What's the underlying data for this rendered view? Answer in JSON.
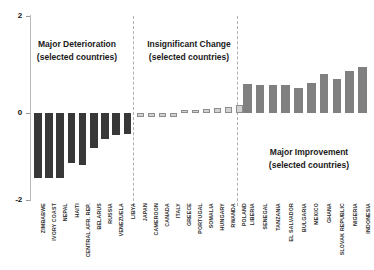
{
  "chart_data": {
    "type": "bar",
    "title": "",
    "xlabel": "",
    "ylabel": "",
    "ylim": [
      -2,
      2
    ],
    "yticks": [
      "2",
      "0",
      "-2"
    ],
    "grid": false,
    "legend": "none",
    "annotations": [
      {
        "line1": "Major Deterioration",
        "line2": "(selected countries)"
      },
      {
        "line1": "Insignificant Change",
        "line2": "(selected countries)"
      },
      {
        "line1": "Major Improvement",
        "line2": "(selected countries)"
      }
    ],
    "groups": [
      {
        "name": "Major Deterioration",
        "color": "#383838",
        "categories": [
          "ZIMBABWE",
          "IVORY COAST",
          "NEPAL",
          "HAITI",
          "CENTRAL AFR. REP.",
          "BELARUS",
          "RUSSIA",
          "VENEZUELA",
          "LIBYA"
        ],
        "values": [
          -1.34,
          -1.34,
          -1.34,
          -1.03,
          -1.07,
          -0.72,
          -0.54,
          -0.46,
          -0.44
        ]
      },
      {
        "name": "Insignificant Change",
        "color": "#d2d2d2",
        "categories": [
          "JAPAN",
          "CAMEROON",
          "CANADA",
          "ITALY",
          "GREECE",
          "PORTUGAL",
          "SOMALIA",
          "HUNGARY",
          "RWANDA",
          "POLAND"
        ],
        "values": [
          -0.09,
          -0.08,
          -0.08,
          -0.07,
          0.04,
          0.05,
          0.09,
          0.1,
          0.13,
          0.16
        ]
      },
      {
        "name": "Major Improvement",
        "color": "#808080",
        "categories": [
          "LIBERIA",
          "SENEGAL",
          "TANZANIA",
          "EL SALVADOR",
          "BULGARIA",
          "MEXICO",
          "GHANA",
          "SLOVAK REPUBLIC",
          "NIGERIA",
          "INDONESIA"
        ],
        "values": [
          0.6,
          0.57,
          0.57,
          0.58,
          0.51,
          0.62,
          0.8,
          0.71,
          0.86,
          0.94
        ]
      }
    ]
  },
  "axis": {
    "tick_top": "2",
    "tick_mid": "0",
    "tick_bottom": "-2"
  },
  "annotations": {
    "left_title": "Major Deterioration",
    "left_sub": "(selected countries)",
    "mid_title": "Insignificant Change",
    "mid_sub": "(selected countries)",
    "right_title": "Major Improvement",
    "right_sub": "(selected countries)"
  }
}
